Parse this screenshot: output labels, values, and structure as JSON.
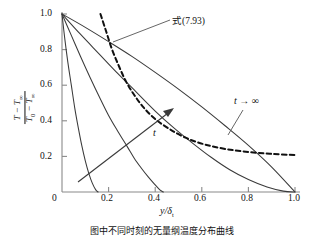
{
  "chart_data": {
    "type": "line",
    "title": "",
    "xlabel": "y/δt",
    "ylabel": "(T − T∞)/(T0 − T∞)",
    "xlim": [
      0,
      1.0
    ],
    "ylim": [
      0,
      1.0
    ],
    "grid": false,
    "legend_position": "in-plot-annotations",
    "xticks": [
      "0",
      "0.2",
      "0.4",
      "0.6",
      "0.8",
      "1.0"
    ],
    "yticks": [
      "0",
      "0.2",
      "0.4",
      "0.6",
      "0.8",
      "1.0"
    ],
    "xtick_values": [
      0,
      0.2,
      0.4,
      0.6,
      0.8,
      1.0
    ],
    "ytick_values": [
      0,
      0.2,
      0.4,
      0.6,
      0.8,
      1.0
    ],
    "series": [
      {
        "name": "t1 (smallest time)",
        "style": "solid",
        "points": [
          [
            0,
            1.0
          ],
          [
            0.012,
            0.86
          ],
          [
            0.025,
            0.73
          ],
          [
            0.04,
            0.6
          ],
          [
            0.055,
            0.47
          ],
          [
            0.07,
            0.36
          ],
          [
            0.085,
            0.26
          ],
          [
            0.1,
            0.175
          ],
          [
            0.115,
            0.105
          ],
          [
            0.13,
            0.05
          ],
          [
            0.145,
            0.012
          ],
          [
            0.155,
            0.0
          ]
        ]
      },
      {
        "name": "t2",
        "style": "solid",
        "points": [
          [
            0,
            1.0
          ],
          [
            0.04,
            0.88
          ],
          [
            0.08,
            0.76
          ],
          [
            0.12,
            0.645
          ],
          [
            0.16,
            0.535
          ],
          [
            0.2,
            0.43
          ],
          [
            0.24,
            0.34
          ],
          [
            0.28,
            0.255
          ],
          [
            0.31,
            0.19
          ],
          [
            0.34,
            0.135
          ],
          [
            0.37,
            0.085
          ],
          [
            0.4,
            0.04
          ],
          [
            0.42,
            0.012
          ],
          [
            0.435,
            0.0
          ]
        ]
      },
      {
        "name": "t3",
        "style": "solid",
        "points": [
          [
            0,
            1.0
          ],
          [
            0.08,
            0.885
          ],
          [
            0.16,
            0.775
          ],
          [
            0.24,
            0.665
          ],
          [
            0.32,
            0.56
          ],
          [
            0.4,
            0.455
          ],
          [
            0.48,
            0.36
          ],
          [
            0.56,
            0.275
          ],
          [
            0.64,
            0.195
          ],
          [
            0.72,
            0.125
          ],
          [
            0.8,
            0.07
          ],
          [
            0.88,
            0.028
          ],
          [
            0.95,
            0.005
          ],
          [
            1.0,
            0.0
          ]
        ]
      },
      {
        "name": "t → ∞",
        "style": "solid",
        "points": [
          [
            0,
            1.0
          ],
          [
            0.1,
            0.925
          ],
          [
            0.2,
            0.845
          ],
          [
            0.3,
            0.762
          ],
          [
            0.4,
            0.672
          ],
          [
            0.5,
            0.578
          ],
          [
            0.6,
            0.478
          ],
          [
            0.7,
            0.372
          ],
          [
            0.8,
            0.262
          ],
          [
            0.9,
            0.14
          ],
          [
            1.0,
            0.0
          ]
        ]
      },
      {
        "name": "式(7.93)",
        "style": "dashed",
        "points": [
          [
            0.165,
            1.0
          ],
          [
            0.19,
            0.9
          ],
          [
            0.215,
            0.8
          ],
          [
            0.245,
            0.705
          ],
          [
            0.275,
            0.62
          ],
          [
            0.31,
            0.545
          ],
          [
            0.35,
            0.475
          ],
          [
            0.4,
            0.41
          ],
          [
            0.46,
            0.355
          ],
          [
            0.53,
            0.305
          ],
          [
            0.61,
            0.268
          ],
          [
            0.7,
            0.242
          ],
          [
            0.8,
            0.225
          ],
          [
            0.9,
            0.214
          ],
          [
            1.0,
            0.208
          ]
        ]
      }
    ],
    "annotations": [
      {
        "name": "equation-label",
        "text": "式(7.93)",
        "target": "dashed curve"
      },
      {
        "name": "t-infinity-label",
        "text": "t → ∞",
        "target": "outermost solid curve"
      },
      {
        "name": "time-direction-arrow",
        "text": "t",
        "target": "direction of increasing time"
      }
    ]
  },
  "axis": {
    "x_ticks": [
      "0",
      "0.2",
      "0.4",
      "0.6",
      "0.8",
      "1.0"
    ],
    "y_ticks": [
      "1.0",
      "0.8",
      "0.6",
      "0.4",
      "0.2",
      "0"
    ],
    "x_label": "y/δ",
    "x_label_sub": "t",
    "y_label_numerator": "T − T",
    "y_label_numerator_sub": "∞",
    "y_label_denominator": "T",
    "y_label_denominator_sub0": "0",
    "y_label_denominator_rest": " − T",
    "y_label_denominator_sub_inf": "∞"
  },
  "labels": {
    "equation": "式(7.93)",
    "t_infinity": "t",
    "t_infinity_arrow": " → ∞",
    "time_arrow": "t"
  },
  "caption": {
    "text": "图中不同时刻的无量纲温度分布曲线"
  },
  "colors": {
    "curve": "#3a3a3a",
    "dashed": "#111111",
    "axis": "#808080",
    "text": "#111111"
  }
}
